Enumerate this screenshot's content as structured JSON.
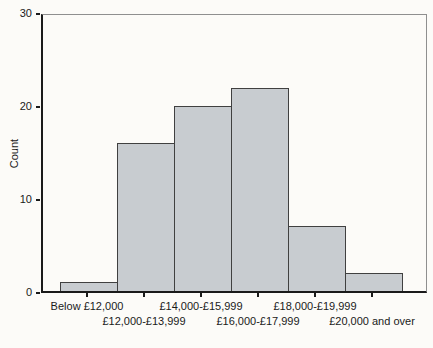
{
  "chart_data": {
    "type": "bar",
    "title": "",
    "ylabel": "Count",
    "xlabel": "",
    "categories": [
      "Below £12,000",
      "£12,000-£13,999",
      "£14,000-£15,999",
      "£16,000-£17,999",
      "£18,000-£19,999",
      "£20,000 and over"
    ],
    "values": [
      1,
      16,
      20,
      22,
      7,
      2
    ],
    "ylim": [
      0,
      30
    ],
    "yticks": [
      0,
      10,
      20,
      30
    ],
    "grid": false,
    "legend": "none",
    "bar_gap": 0,
    "label_layout": "staggered-two-rows"
  },
  "colors": {
    "background": "#fcfbf8",
    "bar_fill": "#c8ccd0",
    "bar_border": "#404040",
    "axis": "#1a1a1a",
    "frame": "#8f8f8f",
    "text": "#1a1a1a"
  }
}
